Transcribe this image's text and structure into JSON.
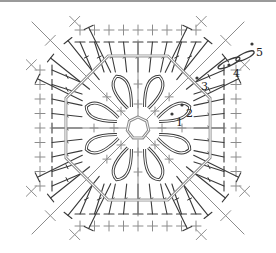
{
  "diagram": {
    "type": "crochet-chart",
    "shape": "square motif",
    "center": [
      138,
      128
    ],
    "colors": {
      "dark_stitch": "#3a3a3a",
      "light_stitch": "#8c8c8c",
      "chain_ring": "#9a9a9a",
      "top_border": "#9a9a9a",
      "background": "#ffffff"
    },
    "round_labels": [
      {
        "id": "1",
        "text": "1",
        "x": 176,
        "y": 126
      },
      {
        "id": "2",
        "text": "2",
        "x": 186,
        "y": 117
      },
      {
        "id": "3",
        "text": "3",
        "x": 201,
        "y": 90
      },
      {
        "id": "4",
        "text": "4",
        "x": 233,
        "y": 77
      },
      {
        "id": "5",
        "text": "5",
        "x": 256,
        "y": 56
      }
    ],
    "petals": 8,
    "edge_stitches_per_side": 9
  }
}
